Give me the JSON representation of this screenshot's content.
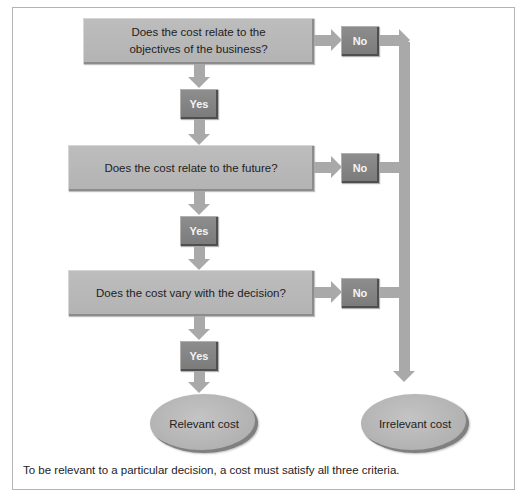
{
  "diagram": {
    "type": "decision-flowchart",
    "questions": [
      {
        "id": "q1",
        "text": "Does the cost relate to the objectives of the business?",
        "line1": "Does the cost relate to the",
        "line2": "objectives of the business?"
      },
      {
        "id": "q2",
        "text": "Does the cost relate to the future?"
      },
      {
        "id": "q3",
        "text": "Does the cost vary with the decision?"
      }
    ],
    "yes_label": "Yes",
    "no_label": "No",
    "outcomes": {
      "relevant": "Relevant cost",
      "irrelevant": "Irrelevant cost"
    },
    "caption": "To be relevant to a particular decision, a cost must satisfy all three criteria.",
    "colors": {
      "question_box": "#b8b8b8",
      "tag_box": "#858585",
      "arrow": "#a9a9a9",
      "frame_border": "#b4b4b4"
    }
  }
}
